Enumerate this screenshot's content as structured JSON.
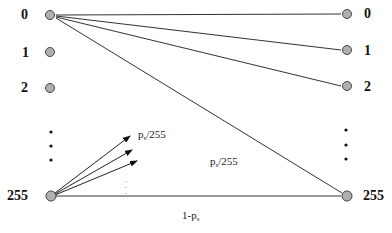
{
  "diagram": {
    "type": "bipartite-transition-graph",
    "left_nodes": [
      {
        "label": "0",
        "x": 50,
        "y": 15
      },
      {
        "label": "1",
        "x": 50,
        "y": 52
      },
      {
        "label": "2",
        "x": 50,
        "y": 88
      },
      {
        "label": "255",
        "x": 50,
        "y": 196
      }
    ],
    "right_nodes": [
      {
        "label": "0",
        "x": 347,
        "y": 14
      },
      {
        "label": "1",
        "x": 347,
        "y": 50
      },
      {
        "label": "2",
        "x": 347,
        "y": 86
      },
      {
        "label": "255",
        "x": 347,
        "y": 196
      }
    ],
    "ellipsis_left": [
      132,
      146,
      160
    ],
    "ellipsis_right": [
      130,
      145,
      159
    ],
    "edge_labels": {
      "fan_out_label_main": "p",
      "fan_out_label_sub": "s",
      "fan_out_label_tail": "/255",
      "diagonal_label_main": "p",
      "diagonal_label_sub": "s",
      "diagonal_label_tail": "/255",
      "self_label_main": "1-p",
      "self_label_sub": "s"
    },
    "colors": {
      "node_fill": "#b0b0b0",
      "node_stroke": "#444444",
      "edge": "#333333"
    }
  }
}
